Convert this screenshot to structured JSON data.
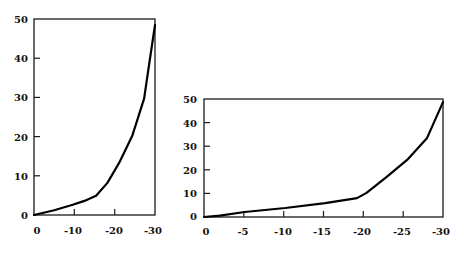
{
  "chart_data": [
    {
      "type": "line",
      "title": "",
      "xlabel": "",
      "ylabel": "",
      "xlim": [
        0,
        -30
      ],
      "ylim": [
        0,
        50
      ],
      "grid": false,
      "legend": null,
      "x_ticks": [
        "0",
        "-10",
        "-20",
        "-30"
      ],
      "y_ticks": [
        "0",
        "10",
        "20",
        "30",
        "40",
        "50"
      ],
      "series": [
        {
          "name": "curve",
          "x": [
            0,
            -5,
            -9.6,
            -12.5,
            -15.4,
            -18.2,
            -21.1,
            -24.4,
            -27.3,
            -28.5,
            -30
          ],
          "y": [
            0,
            1.2,
            2.6,
            3.6,
            4.9,
            8.2,
            13.3,
            20.3,
            29.7,
            38.0,
            48.5
          ]
        }
      ]
    },
    {
      "type": "line",
      "title": "",
      "xlabel": "",
      "ylabel": "",
      "xlim": [
        0,
        -30
      ],
      "ylim": [
        0,
        50
      ],
      "grid": false,
      "legend": null,
      "x_ticks": [
        "0",
        "-5",
        "-10",
        "-15",
        "-20",
        "-25",
        "-30"
      ],
      "y_ticks": [
        "0",
        "10",
        "20",
        "30",
        "40",
        "50"
      ],
      "series": [
        {
          "name": "curve",
          "x": [
            0,
            -2,
            -5.1,
            -10.2,
            -15.2,
            -19.2,
            -20.4,
            -22.9,
            -25.5,
            -28,
            -30
          ],
          "y": [
            0,
            0.6,
            2.1,
            3.8,
            5.9,
            8.0,
            10.2,
            16.9,
            24.2,
            33.5,
            48.7
          ]
        }
      ]
    }
  ],
  "charts": {
    "left": {
      "x_tick_labels": [
        "0",
        "-10",
        "-20",
        "-30"
      ],
      "y_tick_labels": [
        "0",
        "10",
        "20",
        "30",
        "40",
        "50"
      ]
    },
    "right": {
      "x_tick_labels": [
        "0",
        "-5",
        "-10",
        "-15",
        "-20",
        "-25",
        "-30"
      ],
      "y_tick_labels": [
        "0",
        "10",
        "20",
        "30",
        "40",
        "50"
      ]
    }
  },
  "colors": {
    "line": "#000000",
    "axis": "#1a1a1a",
    "background": "#ffffff"
  }
}
